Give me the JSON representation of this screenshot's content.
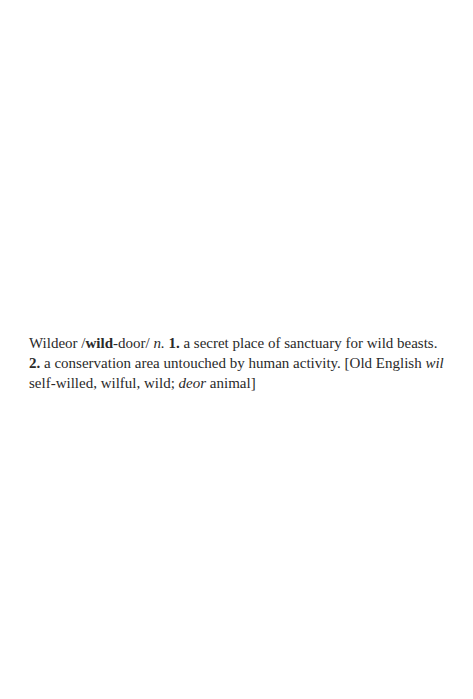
{
  "entry": {
    "headword": "Wildeor",
    "pron_open": " /",
    "pron_bold": "wild",
    "pron_rest": "-door/ ",
    "pos": "n.",
    "sense1_num": "1.",
    "sense1_text": " a secret place of sanctuary for wild beasts.",
    "sense2_num": "2.",
    "sense2_text": " a conservation area untouched by human activity. [Old English ",
    "etym_word1": "wil",
    "etym_text1": " self-willed, wilful, wild; ",
    "etym_word2": "deor",
    "etym_text2": " animal]"
  }
}
